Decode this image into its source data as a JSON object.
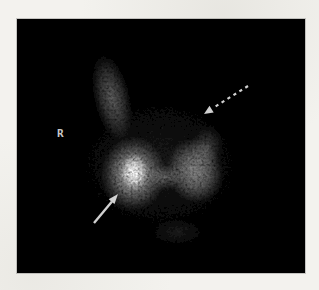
{
  "scan": {
    "kind": "thyroid-scintigraphy-image",
    "orientation_marker": "R",
    "colors": {
      "page_background": "#f3f2ee",
      "scan_background": "#030303",
      "tracer_glow": "#ffffff",
      "annotation_arrow": "#e2e2e2",
      "marker_label": "#c8c8c8"
    },
    "annotations": [
      {
        "name": "solid-arrow",
        "style": "solid",
        "direction": "points up-right",
        "tip_xy": [
          101,
          175
        ],
        "tail_xy": [
          77,
          204
        ]
      },
      {
        "name": "dashed-arrow",
        "style": "dashed",
        "direction": "points down-left",
        "tip_xy": [
          187,
          95
        ],
        "tail_xy": [
          231,
          67
        ]
      }
    ],
    "uptake_regions": [
      {
        "name": "upper-left-column",
        "center_xy": [
          95,
          79
        ],
        "relative_intensity": 0.33
      },
      {
        "name": "left-lobe-hotspot",
        "center_xy": [
          117,
          153
        ],
        "relative_intensity": 0.95
      },
      {
        "name": "left-lobe",
        "center_xy": [
          116,
          155
        ],
        "relative_intensity": 0.62
      },
      {
        "name": "isthmus",
        "center_xy": [
          148,
          158
        ],
        "relative_intensity": 0.3
      },
      {
        "name": "right-lobe",
        "center_xy": [
          178,
          152
        ],
        "relative_intensity": 0.48
      },
      {
        "name": "right-lobe-upper-fringe",
        "center_xy": [
          190,
          127
        ],
        "relative_intensity": 0.22
      },
      {
        "name": "faint-inferior-activity",
        "center_xy": [
          160,
          213
        ],
        "relative_intensity": 0.1
      }
    ]
  }
}
